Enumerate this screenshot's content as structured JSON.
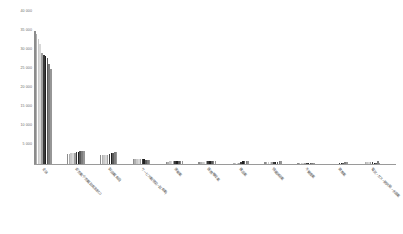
{
  "chart_data": {
    "type": "bar",
    "title": "",
    "subtitle": "",
    "xlabel": "",
    "ylabel": "",
    "grid": false,
    "legend": "none",
    "ylim": [
      0,
      40000
    ],
    "ytick_labels": [
      "40 000",
      "35 000",
      "30 000",
      "25 000",
      "20 000",
      "15 000",
      "10 000",
      "5 000"
    ],
    "ytick_values": [
      40000,
      35000,
      30000,
      25000,
      20000,
      15000,
      10000,
      5000
    ],
    "categories": [
      "全体",
      "卸売業,小売業(飲食店含む)",
      "製造業(食品)",
      "サービス業(宿泊・飲食業)",
      "運輸業",
      "医療,福祉業",
      "建設業",
      "情報通信業",
      "不動産業",
      "教育業",
      "電気・ガス・熱供給・水道業"
    ],
    "series": [
      {
        "name": "2012",
        "color": "#8c8c8c",
        "values": [
          35100,
          2700,
          2400,
          1380,
          620,
          620,
          120,
          430,
          290,
          60,
          70
        ]
      },
      {
        "name": "2013",
        "color": "#b0b0b0",
        "values": [
          34300,
          2750,
          2380,
          1360,
          660,
          610,
          150,
          420,
          280,
          70,
          420
        ]
      },
      {
        "name": "2014",
        "color": "#c9c9c9",
        "values": [
          33000,
          2800,
          2400,
          1340,
          700,
          640,
          160,
          430,
          290,
          90,
          430
        ]
      },
      {
        "name": "2015",
        "color": "#d8d8d8",
        "values": [
          31500,
          2850,
          2420,
          1330,
          720,
          660,
          180,
          440,
          300,
          110,
          440
        ]
      },
      {
        "name": "2016",
        "color": "#a0a0a0",
        "values": [
          29100,
          2900,
          2430,
          1320,
          740,
          670,
          200,
          460,
          300,
          130,
          450
        ]
      },
      {
        "name": "2017",
        "color": "#3a3a3a",
        "values": [
          28600,
          3100,
          2600,
          1260,
          760,
          690,
          650,
          560,
          310,
          330,
          470
        ]
      },
      {
        "name": "2018",
        "color": "#1f1f1f",
        "values": [
          28300,
          3250,
          2800,
          1240,
          780,
          700,
          680,
          600,
          320,
          360,
          360
        ]
      },
      {
        "name": "2019",
        "color": "#5a5a5a",
        "values": [
          27800,
          3350,
          2950,
          1180,
          800,
          720,
          720,
          640,
          330,
          390,
          330
        ]
      },
      {
        "name": "2020",
        "color": "#7d7d7d",
        "values": [
          26200,
          3450,
          3080,
          1120,
          820,
          740,
          760,
          680,
          340,
          410,
          700
        ]
      },
      {
        "name": "2021",
        "color": "#969696",
        "values": [
          25100,
          3500,
          3150,
          1080,
          840,
          760,
          790,
          700,
          350,
          430,
          300
        ]
      }
    ]
  },
  "axis": {
    "y_max_label": "40 000",
    "baseline_color": "#9a9a9a",
    "label_color": "#6a6a6a"
  }
}
